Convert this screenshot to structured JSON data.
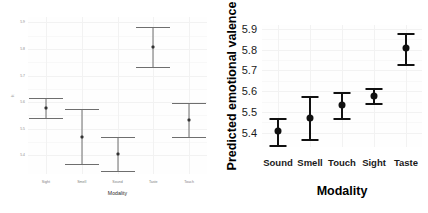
{
  "figure": {
    "panel_count": 2,
    "background_color": "#ffffff"
  },
  "chart_data": [
    {
      "panel": "left",
      "type": "scatter",
      "title": "",
      "xlabel": "Modality",
      "ylabel": "fit",
      "categories": [
        "Sight",
        "Smell",
        "Sound",
        "Taste",
        "Touch"
      ],
      "values": [
        5.578,
        5.47,
        5.405,
        5.807,
        5.532
      ],
      "ci_lower": [
        5.542,
        5.368,
        5.341,
        5.731,
        5.468
      ],
      "ci_upper": [
        5.614,
        5.573,
        5.47,
        5.882,
        5.597
      ],
      "yticks": [
        "5.4",
        "5.5",
        "5.6",
        "5.7",
        "5.8",
        "5.9"
      ],
      "ytick_values": [
        5.4,
        5.5,
        5.6,
        5.7,
        5.8,
        5.9
      ],
      "ylim": [
        5.33,
        5.92
      ],
      "grid": true,
      "legend": "none",
      "marker": "point-with-error-bars"
    },
    {
      "panel": "right",
      "type": "scatter",
      "title": "",
      "xlabel": "Modality",
      "ylabel": "Predicted emotional valence",
      "categories": [
        "Sound",
        "Smell",
        "Touch",
        "Sight",
        "Taste"
      ],
      "values": [
        5.405,
        5.472,
        5.535,
        5.578,
        5.807
      ],
      "ci_lower": [
        5.341,
        5.369,
        5.471,
        5.541,
        5.731
      ],
      "ci_upper": [
        5.47,
        5.576,
        5.598,
        5.615,
        5.882
      ],
      "yticks": [
        "5.4",
        "5.5",
        "5.6",
        "5.7",
        "5.8",
        "5.9"
      ],
      "ytick_values": [
        5.4,
        5.5,
        5.6,
        5.7,
        5.8,
        5.9
      ],
      "ylim": [
        5.33,
        5.92
      ],
      "grid": true,
      "legend": "none",
      "marker": "point-with-error-bars"
    }
  ]
}
